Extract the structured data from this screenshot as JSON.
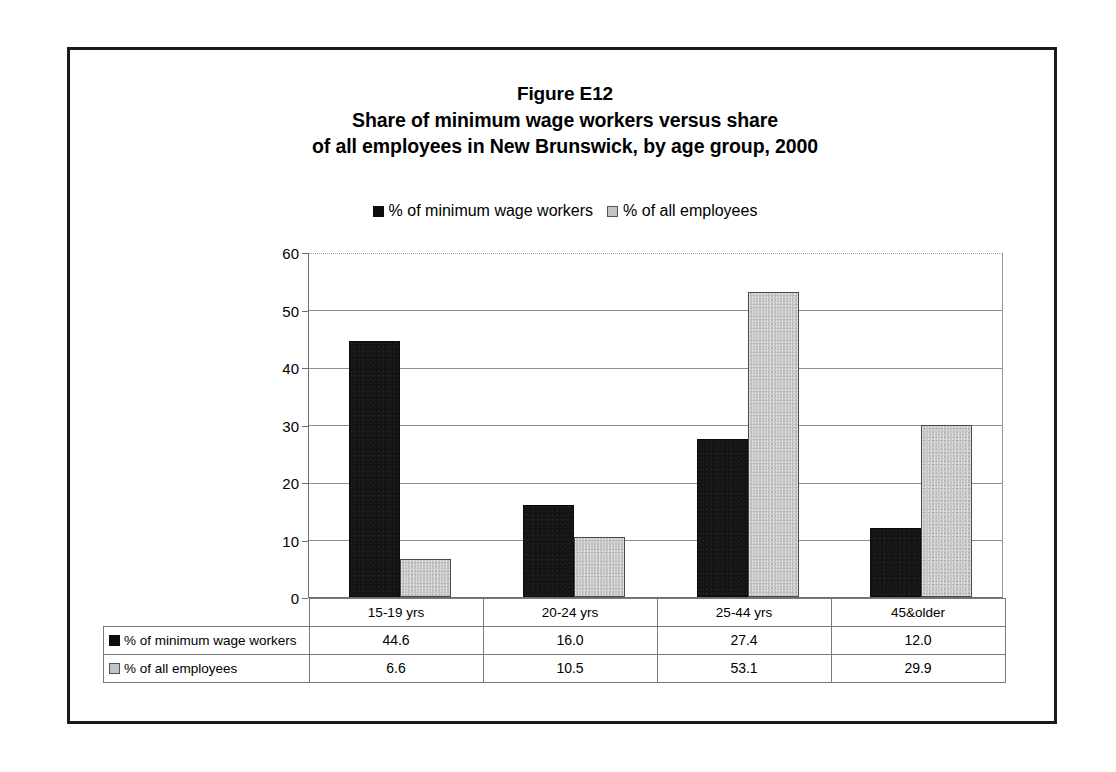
{
  "figure": {
    "title_lines": [
      "Figure E12",
      "Share of minimum wage workers versus share",
      "of all employees in New Brunswick, by age group, 2000"
    ]
  },
  "colors": {
    "series_minimum_wage": "#141414",
    "series_all_employees": "#c6c6c6",
    "frame": "#1a1a1a",
    "gridline": "#8c8c8c"
  },
  "chart_data": {
    "type": "bar",
    "xlabel": "",
    "ylabel": "",
    "ylim": [
      0,
      60
    ],
    "yticks": [
      0,
      10,
      20,
      30,
      40,
      50,
      60
    ],
    "grid": true,
    "legend_position": "top-center",
    "categories": [
      "15-19 yrs",
      "20-24 yrs",
      "25-44 yrs",
      "45&older"
    ],
    "series": [
      {
        "name": "% of minimum wage workers",
        "values": [
          44.6,
          16.0,
          27.4,
          12.0
        ],
        "labels": [
          "44.6",
          "16.0",
          "27.4",
          "12.0"
        ],
        "color": "#141414"
      },
      {
        "name": "% of all employees",
        "values": [
          6.6,
          10.5,
          53.1,
          29.9
        ],
        "labels": [
          "6.6",
          "10.5",
          "53.1",
          "29.9"
        ],
        "color": "#c6c6c6"
      }
    ]
  },
  "ytick_labels": [
    "60",
    "50",
    "40",
    "30",
    "20",
    "10",
    "0"
  ]
}
